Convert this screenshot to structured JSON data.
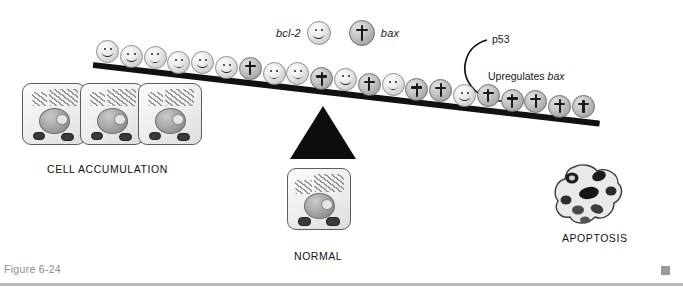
{
  "figure": {
    "caption": "Figure 6-24",
    "end_marker": "square-marker"
  },
  "legend": {
    "bcl2_label": "bcl-2",
    "bcl2_icon": "smiley-face-token",
    "bax_label": "bax",
    "bax_icon": "cross-token"
  },
  "annotations": {
    "p53": "p53",
    "upregulates_prefix": "Upregulates ",
    "upregulates_gene": "bax",
    "arrow": "curved-arrow-down-right"
  },
  "labels": {
    "cell_accumulation": "CELL ACCUMULATION",
    "normal": "NORMAL",
    "apoptosis": "APOPTOSIS"
  },
  "diagram": {
    "type": "balance-seesaw",
    "tilt_degrees": 6.6,
    "heavy_side": "right",
    "fulcrum": "black-triangle",
    "beam_tokens": [
      "bcl2",
      "bcl2",
      "bcl2",
      "bcl2",
      "bcl2",
      "bcl2",
      "bax",
      "bcl2",
      "bcl2",
      "bax",
      "bcl2",
      "bax",
      "bcl2",
      "bax",
      "bax",
      "bcl2",
      "bax",
      "bax",
      "bax",
      "bax",
      "bax"
    ],
    "left_outcome": "CELL ACCUMULATION",
    "center_outcome": "NORMAL",
    "right_outcome": "APOPTOSIS",
    "cell_accumulation_count": 3
  },
  "colors": {
    "beam": "#111111",
    "fulcrum": "#0d0d0d",
    "token_bcl2": "#ececec",
    "token_bax": "#c6c6c6",
    "footer_rule": "#b9b9b9",
    "caption_text": "#8a8a8a"
  }
}
